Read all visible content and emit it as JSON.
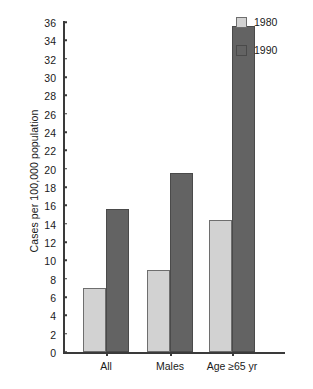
{
  "chart_data": {
    "type": "bar",
    "title": "",
    "subtitle": "",
    "xlabel": "",
    "ylabel": "Cases per 100,000 population",
    "categories": [
      "All",
      "Males",
      "Age ≥65 yr"
    ],
    "series": [
      {
        "name": "1980",
        "color": "#d2d2d2",
        "values": [
          7.0,
          9.0,
          14.4
        ]
      },
      {
        "name": "1990",
        "color": "#636363",
        "values": [
          15.6,
          19.5,
          35.6
        ]
      }
    ],
    "ylim": [
      0,
      36
    ],
    "ytick_step": 2,
    "yticks": [
      36,
      34,
      32,
      30,
      28,
      26,
      24,
      22,
      20,
      18,
      16,
      14,
      12,
      10,
      8,
      6,
      4,
      2,
      0
    ],
    "ytick_labels": [
      "36",
      "34",
      "32",
      "30",
      "28",
      "26",
      "24",
      "22",
      "20",
      "18",
      "16",
      "14",
      "12",
      "10",
      "8",
      "6",
      "4",
      "2",
      "0"
    ],
    "grid": false,
    "legend_position": "top-right",
    "legend_entries": [
      "1980",
      "1990"
    ],
    "annotations": []
  },
  "legend": {
    "items": [
      {
        "label": "1980",
        "swatch_name": "legend-swatch-1980"
      },
      {
        "label": "1990",
        "swatch_name": "legend-swatch-1990"
      }
    ]
  },
  "axes": {
    "y_title": "Cases per 100,000 population"
  }
}
